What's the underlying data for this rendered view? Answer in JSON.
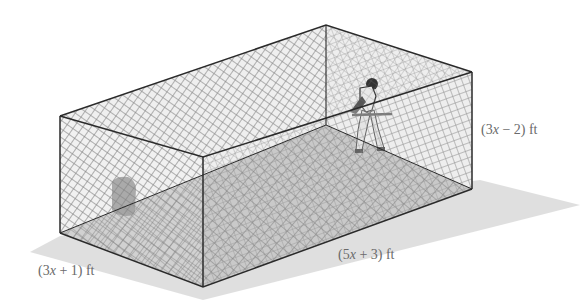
{
  "figure": {
    "labels": {
      "width": "(3x + 1) ft",
      "length": "(5x + 3) ft",
      "height": "(3x − 2) ft"
    },
    "label_parts": {
      "width": {
        "open": "(3",
        "var": "x",
        "close": " + 1) ft"
      },
      "length": {
        "open": "(5",
        "var": "x",
        "close": " + 3) ft"
      },
      "height": {
        "open": "(3",
        "var": "x",
        "close": " − 2) ft"
      }
    },
    "colors": {
      "edge": "#2a2a2a",
      "net": "#7a7a7a",
      "floor": "#c8c8c8",
      "shadow": "#d9d9d9",
      "label": "#6a6a6a",
      "target_pad": "#6e6e6e"
    }
  }
}
